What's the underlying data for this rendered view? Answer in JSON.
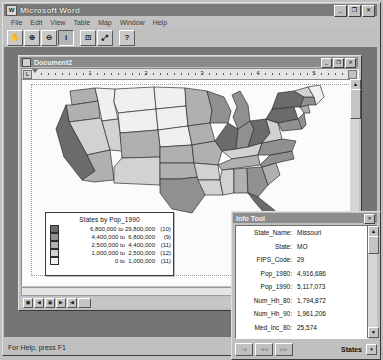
{
  "app": {
    "title": "Microsoft Word",
    "icon": "word-document-icon",
    "window_buttons": [
      {
        "name": "minimize-button",
        "glyph": "_"
      },
      {
        "name": "maximize-button",
        "glyph": "❐"
      },
      {
        "name": "close-button",
        "glyph": "✕"
      }
    ]
  },
  "menu": {
    "items": [
      {
        "label": "File"
      },
      {
        "label": "Edit"
      },
      {
        "label": "View"
      },
      {
        "label": "Table"
      },
      {
        "label": "Map"
      },
      {
        "label": "Window"
      },
      {
        "label": "Help"
      }
    ]
  },
  "toolbar": {
    "buttons": [
      {
        "name": "pan-hand-tool",
        "glyph": "✋",
        "pressed": false
      },
      {
        "name": "zoom-in-tool",
        "glyph": "⊕",
        "pressed": false
      },
      {
        "name": "zoom-out-tool",
        "glyph": "⊖",
        "pressed": false
      },
      {
        "name": "info-tool",
        "glyph": "i",
        "pressed": true
      },
      {
        "name": "label-tool",
        "glyph": "⊡",
        "pressed": false
      },
      {
        "name": "ruler-tool",
        "glyph": "⤢",
        "pressed": false
      },
      {
        "name": "help-tool",
        "glyph": "?",
        "pressed": false
      }
    ]
  },
  "document": {
    "title": "Document2",
    "icon": "document-icon",
    "window_buttons": [
      {
        "name": "doc-minimize-button",
        "glyph": "_"
      },
      {
        "name": "doc-restore-button",
        "glyph": "❐"
      },
      {
        "name": "doc-close-button",
        "glyph": "✕"
      }
    ],
    "ruler": {
      "numbers": [
        "1",
        "2",
        "3",
        "4",
        "5"
      ],
      "unit": "inch"
    },
    "nav_buttons": [
      {
        "name": "nav-first-button",
        "glyph": "◼"
      },
      {
        "name": "nav-prev-button",
        "glyph": "◀"
      },
      {
        "name": "nav-page-button",
        "glyph": "▣"
      },
      {
        "name": "nav-next-button",
        "glyph": "▶"
      },
      {
        "name": "nav-last-button",
        "glyph": "◀"
      },
      {
        "name": "nav-extra-button",
        "glyph": ""
      }
    ],
    "scroll": {
      "up_glyph": "▲",
      "down_glyph": "▼"
    }
  },
  "legend": {
    "title": "States by Pop_1990",
    "rows": [
      {
        "swatch": "#6b6b6b",
        "range": "6,800,000 to 29,800,000",
        "count": "(10)"
      },
      {
        "swatch": "#909090",
        "range": "4,400,000 to  6,800,000",
        "count": "(9)"
      },
      {
        "swatch": "#b0b0b0",
        "range": "2,500,000 to  4,400,000",
        "count": "(11)"
      },
      {
        "swatch": "#d2d2d2",
        "range": "1,000,000 to  2,500,000",
        "count": "(12)"
      },
      {
        "swatch": "#f0f0f0",
        "range": "0 to  1,000,000",
        "count": "(11)"
      }
    ]
  },
  "info_tool": {
    "title": "Info Tool",
    "close_glyph": "✕",
    "fields": [
      {
        "key": "State_Name:",
        "value": "Missouri"
      },
      {
        "key": "State:",
        "value": "MO"
      },
      {
        "key": "FIPS_Code:",
        "value": "29"
      },
      {
        "key": "Pop_1980:",
        "value": "4,916,686"
      },
      {
        "key": "Pop_1990:",
        "value": "5,117,073"
      },
      {
        "key": "Num_Hh_80:",
        "value": "1,794,872"
      },
      {
        "key": "Num_Hh_90:",
        "value": "1,961,206"
      },
      {
        "key": "Med_Inc_80:",
        "value": "25,574"
      },
      {
        "key": "BPI_1990:",
        "value": "1.9812"
      }
    ],
    "footer_buttons": [
      {
        "name": "info-first-button",
        "glyph": "I◀"
      },
      {
        "name": "info-prev-button",
        "glyph": "◀◀"
      },
      {
        "name": "info-next-button",
        "glyph": "▶▶"
      }
    ],
    "layer_label": "States",
    "layer_arrow_glyph": "▾",
    "scroll": {
      "up_glyph": "▲",
      "down_glyph": "▼"
    }
  },
  "status": {
    "text": "For Help, press F1"
  },
  "map": {
    "title": "United States choropleth by 1990 population",
    "shades": {
      "class1": "#6b6b6b",
      "class2": "#909090",
      "class3": "#b0b0b0",
      "class4": "#d2d2d2",
      "class5": "#f0f0f0"
    }
  }
}
